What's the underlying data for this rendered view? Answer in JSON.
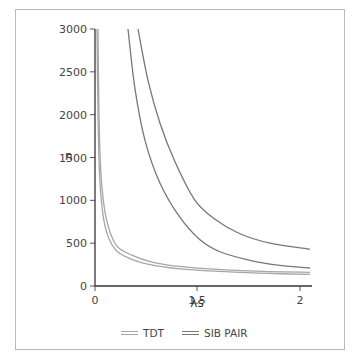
{
  "chart_data": {
    "type": "line",
    "title": "",
    "xlabel": "λs",
    "ylabel": "n",
    "xticks": [
      "0",
      "1.5",
      "2"
    ],
    "yticks": [
      "0",
      "500",
      "1000",
      "1500",
      "2000",
      "2500",
      "3000"
    ],
    "ylim": [
      0,
      3000
    ],
    "grid": false,
    "legend_position": "bottom",
    "legend": [
      "TDT",
      "SIB PAIR"
    ],
    "series": [
      {
        "name": "TDT (curve 1)",
        "group": "TDT",
        "color": "#a6a6a6",
        "x_px": [
          97,
          98,
          100,
          105,
          115,
          130,
          150,
          180,
          220,
          260,
          310
        ],
        "values": [
          3000,
          2000,
          1200,
          700,
          430,
          320,
          250,
          200,
          170,
          150,
          135
        ]
      },
      {
        "name": "TDT (curve 2)",
        "group": "TDT",
        "color": "#a6a6a6",
        "x_px": [
          98,
          99,
          101,
          106,
          116,
          132,
          152,
          182,
          222,
          262,
          310
        ],
        "values": [
          3000,
          2000,
          1300,
          800,
          480,
          360,
          280,
          225,
          190,
          170,
          160
        ]
      },
      {
        "name": "SIB PAIR (curve 1)",
        "group": "SIB PAIR",
        "color": "#777777",
        "x_px": [
          128,
          135,
          145,
          160,
          180,
          200,
          220,
          250,
          280,
          310
        ],
        "values": [
          3000,
          2300,
          1700,
          1200,
          800,
          540,
          400,
          300,
          240,
          210
        ]
      },
      {
        "name": "SIB PAIR (curve 2)",
        "group": "SIB PAIR",
        "color": "#777777",
        "x_px": [
          138,
          148,
          160,
          175,
          195,
          215,
          240,
          270,
          310
        ],
        "values": [
          3000,
          2400,
          1900,
          1450,
          1000,
          780,
          610,
          500,
          430
        ]
      }
    ]
  },
  "axes": {
    "ylabel": "n",
    "xlabel": "λs",
    "yticks": [
      "3000",
      "2500",
      "2000",
      "1500",
      "1000",
      "500",
      "0"
    ],
    "xticks": [
      "0",
      "1.5",
      "2"
    ]
  },
  "legend": {
    "items": [
      {
        "label": "TDT"
      },
      {
        "label": "SIB PAIR"
      }
    ]
  }
}
